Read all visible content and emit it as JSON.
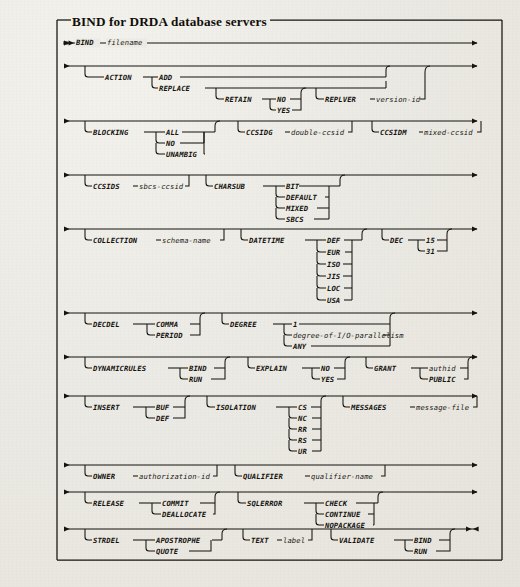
{
  "figure": {
    "title": "BIND for DRDA database servers",
    "type": "railroad-syntax-diagram",
    "ink_color": "#15130f",
    "paper_color": "#eceae4"
  },
  "rows": [
    {
      "id": "row-bind",
      "start_marker": "▸▸",
      "end_marker": "▸",
      "tokens": [
        {
          "text": "BIND",
          "kind": "keyword"
        },
        {
          "text": "filename",
          "kind": "variable"
        }
      ]
    },
    {
      "id": "row-action",
      "start_marker": "▸",
      "end_marker": "▸",
      "tokens": [
        {
          "text": "ACTION",
          "kind": "keyword"
        },
        {
          "text": "ADD",
          "kind": "keyword"
        },
        {
          "text": "REPLACE",
          "kind": "keyword"
        },
        {
          "text": "RETAIN",
          "kind": "keyword"
        },
        {
          "text": "NO",
          "kind": "keyword"
        },
        {
          "text": "YES",
          "kind": "keyword"
        },
        {
          "text": "REPLVER",
          "kind": "keyword"
        },
        {
          "text": "version-id",
          "kind": "variable"
        }
      ]
    },
    {
      "id": "row-blocking",
      "start_marker": "▸",
      "end_marker": "▸",
      "tokens": [
        {
          "text": "BLOCKING",
          "kind": "keyword"
        },
        {
          "text": "ALL",
          "kind": "keyword"
        },
        {
          "text": "NO",
          "kind": "keyword"
        },
        {
          "text": "UNAMBIG",
          "kind": "keyword"
        },
        {
          "text": "CCSIDG",
          "kind": "keyword"
        },
        {
          "text": "double-ccsid",
          "kind": "variable"
        },
        {
          "text": "CCSIDM",
          "kind": "keyword"
        },
        {
          "text": "mixed-ccsid",
          "kind": "variable"
        }
      ]
    },
    {
      "id": "row-ccsids",
      "start_marker": "▸",
      "end_marker": "▸",
      "tokens": [
        {
          "text": "CCSIDS",
          "kind": "keyword"
        },
        {
          "text": "sbcs-ccsid",
          "kind": "variable"
        },
        {
          "text": "CHARSUB",
          "kind": "keyword"
        },
        {
          "text": "BIT",
          "kind": "keyword"
        },
        {
          "text": "DEFAULT",
          "kind": "keyword"
        },
        {
          "text": "MIXED",
          "kind": "keyword"
        },
        {
          "text": "SBCS",
          "kind": "keyword"
        }
      ]
    },
    {
      "id": "row-collection",
      "start_marker": "▸",
      "end_marker": "▸",
      "tokens": [
        {
          "text": "COLLECTION",
          "kind": "keyword"
        },
        {
          "text": "schema-name",
          "kind": "variable"
        },
        {
          "text": "DATETIME",
          "kind": "keyword"
        },
        {
          "text": "DEF",
          "kind": "keyword"
        },
        {
          "text": "EUR",
          "kind": "keyword"
        },
        {
          "text": "ISO",
          "kind": "keyword"
        },
        {
          "text": "JIS",
          "kind": "keyword"
        },
        {
          "text": "LOC",
          "kind": "keyword"
        },
        {
          "text": "USA",
          "kind": "keyword"
        },
        {
          "text": "DEC",
          "kind": "keyword"
        },
        {
          "text": "15",
          "kind": "keyword"
        },
        {
          "text": "31",
          "kind": "keyword"
        }
      ]
    },
    {
      "id": "row-decdel",
      "start_marker": "▸",
      "end_marker": "▸",
      "tokens": [
        {
          "text": "DECDEL",
          "kind": "keyword"
        },
        {
          "text": "COMMA",
          "kind": "keyword"
        },
        {
          "text": "PERIOD",
          "kind": "keyword"
        },
        {
          "text": "DEGREE",
          "kind": "keyword"
        },
        {
          "text": "1",
          "kind": "keyword"
        },
        {
          "text": "degree-of-I/O-parallelism",
          "kind": "variable"
        },
        {
          "text": "ANY",
          "kind": "keyword"
        }
      ]
    },
    {
      "id": "row-dynamicrules",
      "start_marker": "▸",
      "end_marker": "▸",
      "tokens": [
        {
          "text": "DYNAMICRULES",
          "kind": "keyword"
        },
        {
          "text": "BIND",
          "kind": "keyword"
        },
        {
          "text": "RUN",
          "kind": "keyword"
        },
        {
          "text": "EXPLAIN",
          "kind": "keyword"
        },
        {
          "text": "NO",
          "kind": "keyword"
        },
        {
          "text": "YES",
          "kind": "keyword"
        },
        {
          "text": "GRANT",
          "kind": "keyword"
        },
        {
          "text": "authid",
          "kind": "variable"
        },
        {
          "text": "PUBLIC",
          "kind": "keyword"
        }
      ]
    },
    {
      "id": "row-insert",
      "start_marker": "▸",
      "end_marker": "▸",
      "tokens": [
        {
          "text": "INSERT",
          "kind": "keyword"
        },
        {
          "text": "BUF",
          "kind": "keyword"
        },
        {
          "text": "DEF",
          "kind": "keyword"
        },
        {
          "text": "ISOLATION",
          "kind": "keyword"
        },
        {
          "text": "CS",
          "kind": "keyword"
        },
        {
          "text": "NC",
          "kind": "keyword"
        },
        {
          "text": "RR",
          "kind": "keyword"
        },
        {
          "text": "RS",
          "kind": "keyword"
        },
        {
          "text": "UR",
          "kind": "keyword"
        },
        {
          "text": "MESSAGES",
          "kind": "keyword"
        },
        {
          "text": "message-file",
          "kind": "variable"
        }
      ]
    },
    {
      "id": "row-owner",
      "start_marker": "▸",
      "end_marker": "▸",
      "tokens": [
        {
          "text": "OWNER",
          "kind": "keyword"
        },
        {
          "text": "authorization-id",
          "kind": "variable"
        },
        {
          "text": "QUALIFIER",
          "kind": "keyword"
        },
        {
          "text": "qualifier-name",
          "kind": "variable"
        }
      ]
    },
    {
      "id": "row-release",
      "start_marker": "▸",
      "end_marker": "▸",
      "tokens": [
        {
          "text": "RELEASE",
          "kind": "keyword"
        },
        {
          "text": "COMMIT",
          "kind": "keyword"
        },
        {
          "text": "DEALLOCATE",
          "kind": "keyword"
        },
        {
          "text": "SQLERROR",
          "kind": "keyword"
        },
        {
          "text": "CHECK",
          "kind": "keyword"
        },
        {
          "text": "CONTINUE",
          "kind": "keyword"
        },
        {
          "text": "NOPACKAGE",
          "kind": "keyword"
        }
      ]
    },
    {
      "id": "row-strdel",
      "start_marker": "▸",
      "end_marker": "▸◂",
      "tokens": [
        {
          "text": "STRDEL",
          "kind": "keyword"
        },
        {
          "text": "APOSTROPHE",
          "kind": "keyword"
        },
        {
          "text": "QUOTE",
          "kind": "keyword"
        },
        {
          "text": "TEXT",
          "kind": "keyword"
        },
        {
          "text": "label",
          "kind": "variable"
        },
        {
          "text": "VALIDATE",
          "kind": "keyword"
        },
        {
          "text": "BIND",
          "kind": "keyword"
        },
        {
          "text": "RUN",
          "kind": "keyword"
        }
      ]
    }
  ],
  "labels": {
    "t_BIND": "BIND",
    "t_filename": "filename",
    "t_ACTION": "ACTION",
    "t_ADD": "ADD",
    "t_REPLACE": "REPLACE",
    "t_RETAIN": "RETAIN",
    "t_NO1": "NO",
    "t_YES1": "YES",
    "t_REPLVER": "REPLVER",
    "t_versionid": "version-id",
    "t_BLOCKING": "BLOCKING",
    "t_ALL": "ALL",
    "t_NO2": "NO",
    "t_UNAMBIG": "UNAMBIG",
    "t_CCSIDG": "CCSIDG",
    "t_doubleccsid": "double-ccsid",
    "t_CCSIDM": "CCSIDM",
    "t_mixedccsid": "mixed-ccsid",
    "t_CCSIDS": "CCSIDS",
    "t_sbcsccsid": "sbcs-ccsid",
    "t_CHARSUB": "CHARSUB",
    "t_BIT": "BIT",
    "t_DEFAULT": "DEFAULT",
    "t_MIXED": "MIXED",
    "t_SBCS": "SBCS",
    "t_COLLECTION": "COLLECTION",
    "t_schemaname": "schema-name",
    "t_DATETIME": "DATETIME",
    "t_DEF1": "DEF",
    "t_EUR": "EUR",
    "t_ISO": "ISO",
    "t_JIS": "JIS",
    "t_LOC": "LOC",
    "t_USA": "USA",
    "t_DEC": "DEC",
    "t_15": "15",
    "t_31": "31",
    "t_DECDEL": "DECDEL",
    "t_COMMA": "COMMA",
    "t_PERIOD": "PERIOD",
    "t_DEGREE": "DEGREE",
    "t_1": "1",
    "t_degreepar": "degree-of-I/O-parallelism",
    "t_ANY": "ANY",
    "t_DYNAMICRULES": "DYNAMICRULES",
    "t_BIND2": "BIND",
    "t_RUN1": "RUN",
    "t_EXPLAIN": "EXPLAIN",
    "t_NO3": "NO",
    "t_YES2": "YES",
    "t_GRANT": "GRANT",
    "t_authid": "authid",
    "t_PUBLIC": "PUBLIC",
    "t_INSERT": "INSERT",
    "t_BUF": "BUF",
    "t_DEF2": "DEF",
    "t_ISOLATION": "ISOLATION",
    "t_CS": "CS",
    "t_NC": "NC",
    "t_RR": "RR",
    "t_RS": "RS",
    "t_UR": "UR",
    "t_MESSAGES": "MESSAGES",
    "t_messagefile": "message-file",
    "t_OWNER": "OWNER",
    "t_authorizationid": "authorization-id",
    "t_QUALIFIER": "QUALIFIER",
    "t_qualifiername": "qualifier-name",
    "t_RELEASE": "RELEASE",
    "t_COMMIT": "COMMIT",
    "t_DEALLOCATE": "DEALLOCATE",
    "t_SQLERROR": "SQLERROR",
    "t_CHECK": "CHECK",
    "t_CONTINUE": "CONTINUE",
    "t_NOPACKAGE": "NOPACKAGE",
    "t_STRDEL": "STRDEL",
    "t_APOSTROPHE": "APOSTROPHE",
    "t_QUOTE": "QUOTE",
    "t_TEXT": "TEXT",
    "t_label": "label",
    "t_VALIDATE": "VALIDATE",
    "t_BIND3": "BIND",
    "t_RUN2": "RUN"
  }
}
